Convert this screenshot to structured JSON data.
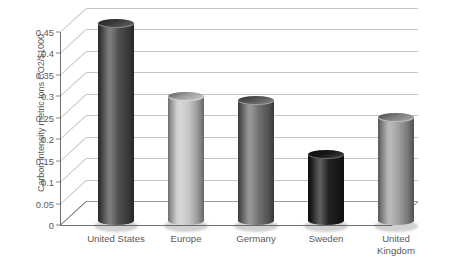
{
  "chart_data": {
    "type": "bar",
    "title": "",
    "subtitle": "",
    "xlabel": "",
    "ylabel": "Carbon intensity metric tons CO2/$1000",
    "categories": [
      "United States",
      "Europe",
      "Germany",
      "Sweden",
      "United Kingdom"
    ],
    "values": [
      0.47,
      0.3,
      0.29,
      0.165,
      0.25
    ],
    "series": [
      {
        "name": "Carbon intensity",
        "values": [
          0.47,
          0.3,
          0.29,
          0.165,
          0.25
        ]
      }
    ],
    "ylim": [
      0,
      0.47
    ],
    "y_ticks": [
      0,
      0.05,
      0.1,
      0.15,
      0.2,
      0.25,
      0.3,
      0.35,
      0.4,
      0.45
    ],
    "y_tick_labels": [
      "0",
      "0.05",
      "0.1",
      "0.15",
      "0.2",
      "0.25",
      "0.3",
      "0.35",
      "0.4",
      "0.45"
    ],
    "grid": true,
    "grid_axis": "y",
    "legend": false,
    "legend_position": "none",
    "style": "3d-cylinder",
    "bar_colors": [
      "#4a4a4a",
      "#c6c6c6",
      "#6d6d6d",
      "#1c1c1c",
      "#9c9c9c"
    ],
    "background_color": "#ffffff",
    "grid_color": "#c4c4c4",
    "axis_color": "#6f6f6f",
    "text_color": "#5a5a5a"
  },
  "axis": {
    "y_title": "Carbon intensity metric tons CO2/$1000",
    "ticks": [
      {
        "label": "0.45",
        "value": 0.45
      },
      {
        "label": "0.4",
        "value": 0.4
      },
      {
        "label": "0.35",
        "value": 0.35
      },
      {
        "label": "0.3",
        "value": 0.3
      },
      {
        "label": "0.25",
        "value": 0.25
      },
      {
        "label": "0.2",
        "value": 0.2
      },
      {
        "label": "0.15",
        "value": 0.15
      },
      {
        "label": "0.1",
        "value": 0.1
      },
      {
        "label": "0.05",
        "value": 0.05
      },
      {
        "label": "0",
        "value": 0
      }
    ]
  },
  "categories": [
    {
      "label": "United States",
      "lines": [
        "United States"
      ],
      "value": 0.47,
      "color": "#4a4a4a"
    },
    {
      "label": "Europe",
      "lines": [
        "Europe"
      ],
      "value": 0.3,
      "color": "#c6c6c6"
    },
    {
      "label": "Germany",
      "lines": [
        "Germany"
      ],
      "value": 0.29,
      "color": "#6d6d6d"
    },
    {
      "label": "Sweden",
      "lines": [
        "Sweden"
      ],
      "value": 0.165,
      "color": "#1c1c1c"
    },
    {
      "label": "United Kingdom",
      "lines": [
        "United",
        "Kingdom"
      ],
      "value": 0.25,
      "color": "#9c9c9c"
    }
  ]
}
